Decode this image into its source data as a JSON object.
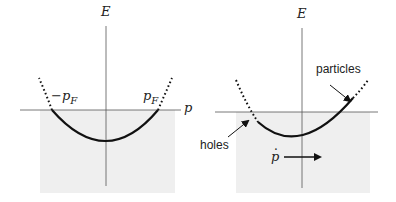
{
  "colors": {
    "shade": "#efefef",
    "ink": "#111111",
    "axis": "#555555"
  },
  "left_panel": {
    "axis_e_label": "E",
    "axis_p_label": "p",
    "neg_fermi_label_main": "−p",
    "neg_fermi_label_sub": "F",
    "pos_fermi_label_main": "p",
    "pos_fermi_label_sub": "F"
  },
  "right_panel": {
    "axis_e_label": "E",
    "particles_label": "particles",
    "holes_label": "holes",
    "pdot_label": "p"
  }
}
